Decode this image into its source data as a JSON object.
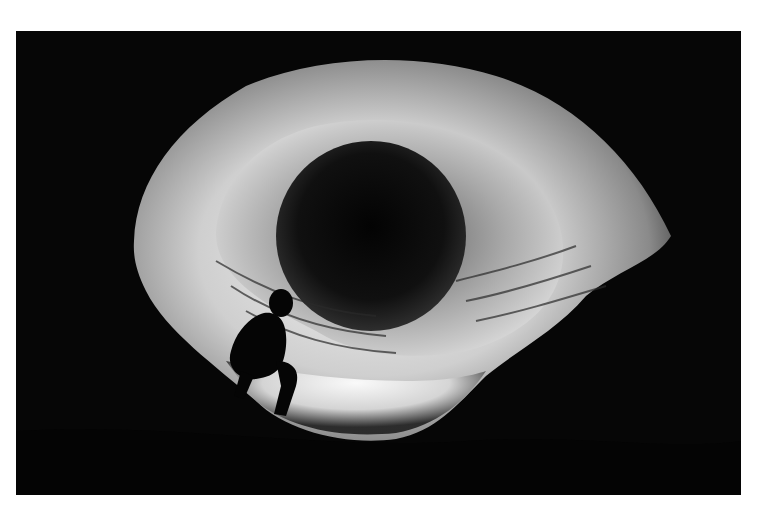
{
  "image": {
    "subject": "Black and white photograph of a cave tunnel with a person crouching at the lit entrance",
    "colors": {
      "background": "#ffffff",
      "darkness": "#060606",
      "rock_light": "#e8e8e8",
      "rock_mid": "#9a9a9a",
      "tunnel_dark": "#0c0c0c"
    }
  }
}
